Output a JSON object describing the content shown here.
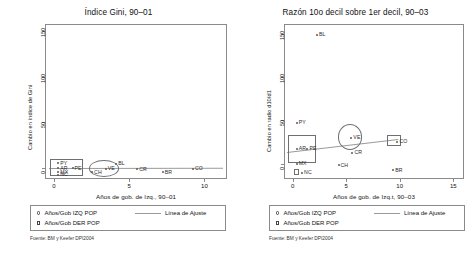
{
  "figure": {
    "panels": [
      {
        "key": "gini",
        "title": "Índice Gini, 90–01",
        "ylabel": "Cambio en índice de Gini",
        "xlabel": "Años de gob. de Izq., 90–01",
        "source": "Fuente: BM y Keefer DPI2004",
        "yticks": [
          "0",
          "50",
          "100",
          "150"
        ],
        "xticks": [
          "0",
          "5",
          "10"
        ],
        "legend": {
          "izq_label": "Años/Gob IZQ POP",
          "der_label": "Años/Gob DER POP",
          "fit_label": "Línea de Ajuste"
        }
      },
      {
        "key": "d10d1",
        "title": "Razón 10o decil sobre 1er decil, 90–03",
        "ylabel": "Cambio en radio d10/d1",
        "xlabel": "Años de gob. de Izq.t, 90–03",
        "source": "Fuente: BM y Keefer DPI2004",
        "yticks": [
          "0",
          "50",
          "100",
          "150"
        ],
        "xticks": [
          "0",
          "5",
          "10",
          "15"
        ],
        "legend": {
          "izq_label": "Años/Gob IZQ POP",
          "der_label": "Años/Gob DER POP",
          "fit_label": "Línea de Ajuste"
        }
      }
    ]
  },
  "chart_data": [
    {
      "type": "scatter",
      "title": "Índice Gini, 90–01",
      "xlabel": "Años de gob. de Izq., 90–01",
      "ylabel": "Cambio en índice de Gini",
      "xlim": [
        -0.6,
        11.5
      ],
      "ylim": [
        -12,
        158
      ],
      "xticks": [
        0,
        5,
        10
      ],
      "yticks": [
        0,
        50,
        100,
        150
      ],
      "grid": false,
      "legend_position": "below-axis",
      "series": [
        {
          "name": "Años/Gob IZQ POP",
          "marker": "circle",
          "points": [
            {
              "label": "PY",
              "x": 0.15,
              "y": 7.0
            },
            {
              "label": "AR",
              "x": 0.15,
              "y": 1.5
            },
            {
              "label": "PE",
              "x": 1.1,
              "y": 1.5
            },
            {
              "label": "MX",
              "x": 0.15,
              "y": -3.0
            },
            {
              "label": "NC",
              "x": 0.15,
              "y": -5.5
            },
            {
              "label": "BL",
              "x": 4.0,
              "y": 6.5
            },
            {
              "label": "VE",
              "x": 3.3,
              "y": 1.0
            },
            {
              "label": "CH",
              "x": 2.4,
              "y": -3.0
            },
            {
              "label": "CR",
              "x": 5.4,
              "y": 0.5
            },
            {
              "label": "BR",
              "x": 7.1,
              "y": -3.0
            },
            {
              "label": "CO",
              "x": 9.1,
              "y": 1.0
            }
          ]
        }
      ],
      "annotations": [
        {
          "kind": "rect",
          "note": "highlight box around PY/AR/PE/MX/NC cluster",
          "x0": -0.35,
          "x1": 1.85,
          "y0": -7.5,
          "y1": 11.0
        },
        {
          "kind": "circle",
          "note": "highlight circle around VE",
          "cx": 3.25,
          "cy": 0.5,
          "r_x": 1.0,
          "r_y": 9.0
        }
      ],
      "fit_line": {
        "label": "Línea de Ajuste",
        "x0": -0.4,
        "y0": 0.8,
        "x1": 11.2,
        "y1": 1.2
      }
    },
    {
      "type": "scatter",
      "title": "Razón 10o decil sobre 1er decil, 90–03",
      "xlabel": "Años de gob. de Izq.t, 90–03",
      "ylabel": "Cambio en radio d10/d1",
      "xlim": [
        -0.8,
        16.0
      ],
      "ylim": [
        -18,
        162
      ],
      "xticks": [
        0,
        5,
        10,
        15
      ],
      "yticks": [
        0,
        50,
        100,
        150
      ],
      "grid": false,
      "legend_position": "below-axis",
      "series": [
        {
          "name": "Años/Gob IZQ POP",
          "marker": "circle",
          "points": [
            {
              "label": "BL",
              "x": 2.1,
              "y": 151.0
            },
            {
              "label": "PY",
              "x": 0.2,
              "y": 49.0
            },
            {
              "label": "AR",
              "x": 0.2,
              "y": 19.0
            },
            {
              "label": "PE",
              "x": 1.2,
              "y": 19.0
            },
            {
              "label": "MX",
              "x": 0.2,
              "y": 1.5
            },
            {
              "label": "NC",
              "x": 0.7,
              "y": -9.0
            },
            {
              "label": "VE",
              "x": 5.3,
              "y": 32.0
            },
            {
              "label": "CR",
              "x": 5.4,
              "y": 14.0
            },
            {
              "label": "CH",
              "x": 4.1,
              "y": 0.0
            },
            {
              "label": "BR",
              "x": 9.2,
              "y": -6.0
            },
            {
              "label": "CO",
              "x": 9.6,
              "y": 27.0
            }
          ]
        }
      ],
      "annotations": [
        {
          "kind": "rect",
          "note": "highlight box around AR/PE/MX cluster",
          "x0": -0.5,
          "x1": 2.1,
          "y0": 2.0,
          "y1": 34.0
        },
        {
          "kind": "circle",
          "note": "highlight circle around VE",
          "cx": 5.25,
          "cy": 32.0,
          "r_x": 1.15,
          "r_y": 15.0
        },
        {
          "kind": "rect",
          "note": "highlight box around CO",
          "x0": 8.7,
          "x1": 10.0,
          "y0": 21.0,
          "y1": 34.0
        },
        {
          "kind": "rect",
          "note": "small highlight box at NC cluster",
          "x0": 0.0,
          "x1": 0.55,
          "y0": -12.5,
          "y1": -5.5
        }
      ],
      "fit_line": {
        "label": "Línea de Ajuste",
        "x0": -0.6,
        "y0": 14.0,
        "x1": 9.8,
        "y1": 29.0
      }
    }
  ]
}
